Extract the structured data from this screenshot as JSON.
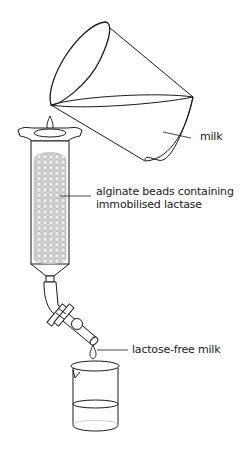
{
  "diagram": {
    "labels": {
      "milk": "milk",
      "beads_line1": "alginate beads containing",
      "beads_line2": "immobilised lactase",
      "product": "lactose-free milk"
    },
    "components": [
      {
        "id": "jug",
        "description": "tilted jug pouring milk"
      },
      {
        "id": "drop-top",
        "description": "drop of milk entering column"
      },
      {
        "id": "column",
        "description": "glass column with funnel top"
      },
      {
        "id": "beads",
        "description": "packed alginate beads"
      },
      {
        "id": "tap",
        "description": "bent outlet tube with stopcock"
      },
      {
        "id": "drop-bottom",
        "description": "drop of lactose-free milk"
      },
      {
        "id": "beaker",
        "description": "beaker collecting product"
      }
    ],
    "colors": {
      "line": "#1a1a1a",
      "beads_fill": "#c8c8c8",
      "background": "#ffffff"
    }
  }
}
